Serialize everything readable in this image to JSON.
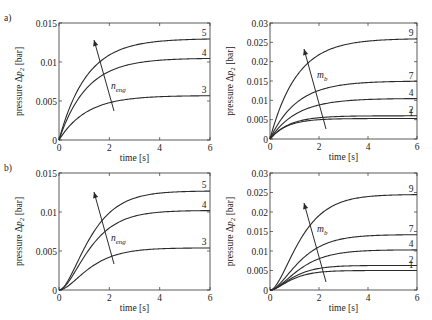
{
  "chart_data": [
    {
      "panel": "a-left",
      "row_label": "a)",
      "type": "line",
      "xlabel": "time [s]",
      "ylabel": "pressure Δp2 [bar]",
      "xlim": [
        0,
        6
      ],
      "ylim": [
        0,
        0.015
      ],
      "xticks": [
        "0",
        "2",
        "4",
        "6"
      ],
      "yticks": [
        "0",
        "0.005",
        "0.01",
        "0.015"
      ],
      "arrow_label": "n_eng",
      "shape": "first-order",
      "series": [
        {
          "name": "5",
          "final": 0.013,
          "tau": 1.1
        },
        {
          "name": "4",
          "final": 0.0105,
          "tau": 1.1
        },
        {
          "name": "3",
          "final": 0.0057,
          "tau": 1.1
        }
      ]
    },
    {
      "panel": "a-right",
      "row_label": "",
      "type": "line",
      "xlabel": "time [s]",
      "ylabel": "pressure Δp2 [bar]",
      "xlim": [
        0,
        6
      ],
      "ylim": [
        0,
        0.03
      ],
      "xticks": [
        "0",
        "2",
        "4",
        "6"
      ],
      "yticks": [
        "0",
        "0.005",
        "0.01",
        "0.015",
        "0.02",
        "0.025",
        "0.03"
      ],
      "arrow_label": "m_b",
      "shape": "first-order",
      "series": [
        {
          "name": "9",
          "final": 0.026,
          "tau": 1.1
        },
        {
          "name": "7",
          "final": 0.015,
          "tau": 1.1
        },
        {
          "name": "4",
          "final": 0.0105,
          "tau": 1.1
        },
        {
          "name": "2",
          "final": 0.006,
          "tau": 0.8
        },
        {
          "name": "1",
          "final": 0.0053,
          "tau": 0.7
        }
      ]
    },
    {
      "panel": "b-left",
      "row_label": "b)",
      "type": "line",
      "xlabel": "time [s]",
      "ylabel": "pressure Δp2 [bar]",
      "xlim": [
        0,
        6
      ],
      "ylim": [
        0,
        0.015
      ],
      "xticks": [
        "0",
        "2",
        "4",
        "6"
      ],
      "yticks": [
        "0",
        "0.005",
        "0.01",
        "0.015"
      ],
      "arrow_label": "n_eng",
      "shape": "second-order",
      "series": [
        {
          "name": "5",
          "final": 0.0127,
          "tau": 0.7
        },
        {
          "name": "4",
          "final": 0.0102,
          "tau": 0.7
        },
        {
          "name": "3",
          "final": 0.0054,
          "tau": 0.7
        }
      ]
    },
    {
      "panel": "b-right",
      "row_label": "",
      "type": "line",
      "xlabel": "time [s]",
      "ylabel": "pressure Δp2 [bar]",
      "xlim": [
        0,
        6
      ],
      "ylim": [
        0,
        0.03
      ],
      "xticks": [
        "0",
        "2",
        "4",
        "6"
      ],
      "yticks": [
        "0",
        "0.005",
        "0.01",
        "0.015",
        "0.02",
        "0.025",
        "0.03"
      ],
      "arrow_label": "m_b",
      "shape": "second-order",
      "series": [
        {
          "name": "9",
          "final": 0.0245,
          "tau": 0.7
        },
        {
          "name": "7",
          "final": 0.0142,
          "tau": 0.7
        },
        {
          "name": "4",
          "final": 0.0103,
          "tau": 0.7
        },
        {
          "name": "2",
          "final": 0.0063,
          "tau": 0.55
        },
        {
          "name": "1",
          "final": 0.005,
          "tau": 0.5
        }
      ]
    }
  ],
  "layout": {
    "panels": [
      {
        "x0": 59,
        "x1": 210,
        "y0": 23,
        "y1": 140,
        "arrow": [
          114,
          111,
          94,
          40
        ],
        "arrow_label_pos": [
          111,
          89
        ]
      },
      {
        "x0": 270,
        "x1": 417,
        "y0": 23,
        "y1": 139,
        "arrow": [
          326,
          129,
          304,
          49
        ],
        "arrow_label_pos": [
          317,
          78
        ]
      },
      {
        "x0": 59,
        "x1": 210,
        "y0": 173,
        "y1": 290,
        "arrow": [
          114,
          264,
          94,
          192
        ],
        "arrow_label_pos": [
          111,
          241
        ]
      },
      {
        "x0": 270,
        "x1": 417,
        "y0": 173,
        "y1": 290,
        "arrow": [
          326,
          282,
          304,
          203
        ],
        "arrow_label_pos": [
          317,
          232
        ]
      }
    ]
  }
}
